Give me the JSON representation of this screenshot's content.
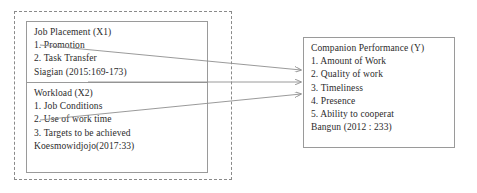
{
  "diagram": {
    "line_color": "#9a9a9a",
    "dashed_color": "#8a8a8a",
    "text_color": "#2b2b2b",
    "background": "#ffffff"
  },
  "independent_group": {
    "variables": [
      {
        "title": "Job Placement (X1)",
        "indicators": [
          "1. Promotion",
          "2. Task Transfer"
        ],
        "source": "Siagian (2015:169-173)"
      },
      {
        "title": "Workload (X2)",
        "indicators": [
          "1. Job Conditions",
          "2. Use of work time",
          "3. Targets to be achieved"
        ],
        "source": "Koesmowidjojo(2017:33)"
      }
    ]
  },
  "dependent_variable": {
    "title": "Companion Performance (Y)",
    "indicators": [
      "1. Amount of Work",
      "2. Quality of work",
      "3. Timeliness",
      "4. Presence",
      "5. Ability to cooperat"
    ],
    "source": "Bangun (2012 : 233)"
  },
  "arrows": [
    {
      "name": "arrow-x1-to-y",
      "from": "Job Placement (X1)",
      "to": "Companion Performance (Y)"
    },
    {
      "name": "arrow-group-to-y",
      "from": "Job Placement and Workload",
      "to": "Companion Performance (Y)"
    },
    {
      "name": "arrow-x2-to-y",
      "from": "Workload (X2)",
      "to": "Companion Performance (Y)"
    }
  ]
}
